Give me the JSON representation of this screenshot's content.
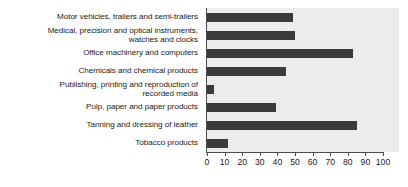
{
  "chart_data": {
    "type": "bar",
    "orientation": "horizontal",
    "title": "",
    "xlabel": "",
    "ylabel": "",
    "xlim": [
      0,
      100
    ],
    "xticks": [
      0,
      10,
      20,
      30,
      40,
      50,
      60,
      70,
      80,
      90,
      100
    ],
    "grid": false,
    "legend": "none",
    "bar_color": "#3b3b3b",
    "plot_background": "#ececec",
    "categories": [
      "Motor vehicles, trailers and semi-trailers",
      "Medical, precision and optical instruments,\nwatches and clocks",
      "Office machinery and computers",
      "Chemicals and chemical products",
      "Publishing, printing and reproduction of\nrecorded media",
      "Pulp, paper and paper products",
      "Tanning and dressing of leather",
      "Tobacco products"
    ],
    "values": [
      49,
      50,
      83,
      45,
      4,
      39,
      85,
      12
    ]
  },
  "rows": [
    {
      "label": "Motor vehicles, trailers and semi-trailers",
      "value": 49,
      "lines": 1
    },
    {
      "label": "Medical, precision and optical instruments,\nwatches and clocks",
      "value": 50,
      "lines": 2
    },
    {
      "label": "Office machinery and computers",
      "value": 83,
      "lines": 1
    },
    {
      "label": "Chemicals and chemical products",
      "value": 45,
      "lines": 1
    },
    {
      "label": "Publishing, printing and reproduction of\nrecorded media",
      "value": 4,
      "lines": 2
    },
    {
      "label": "Pulp, paper and paper products",
      "value": 39,
      "lines": 1
    },
    {
      "label": "Tanning and dressing of leather",
      "value": 85,
      "lines": 1
    },
    {
      "label": "Tobacco products",
      "value": 12,
      "lines": 1
    }
  ],
  "axis": {
    "ticks": [
      "0",
      "10",
      "20",
      "30",
      "40",
      "50",
      "60",
      "70",
      "80",
      "90",
      "100"
    ]
  }
}
